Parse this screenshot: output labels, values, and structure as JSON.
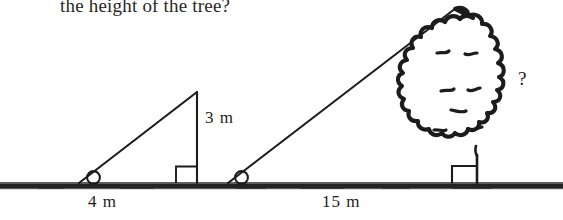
{
  "figure": {
    "type": "geometry-diagram",
    "topic": "similar-triangles-shadow-tree-height",
    "question_text": "the height of the tree?",
    "ink_color": "#1c1c1c",
    "background_color": "#ffffff",
    "ground_color": "#232323",
    "labels": {
      "small_triangle_height": "3 m",
      "small_triangle_base": "4 m",
      "large_triangle_base": "15 m",
      "unknown_height": "?"
    },
    "objects": {
      "ground_line": "ground-line",
      "small_triangle": "small-right-triangle",
      "small_triangle_angle_marker": "angle-arc-marker",
      "small_triangle_right_angle": "right-angle-square",
      "large_triangle_hypotenuse": "sight-line",
      "large_triangle_angle_marker": "angle-arc-marker",
      "tree": "tree-illustration",
      "tree_trunk": "tree-trunk",
      "tree_right_angle": "right-angle-square"
    }
  }
}
